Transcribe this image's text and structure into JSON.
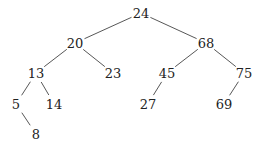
{
  "diagram": {
    "type": "binary-search-tree",
    "nodes": [
      {
        "id": "n24",
        "label": "24",
        "x": 141,
        "y": 13
      },
      {
        "id": "n20",
        "label": "20",
        "x": 75,
        "y": 43
      },
      {
        "id": "n68",
        "label": "68",
        "x": 206,
        "y": 43
      },
      {
        "id": "n13",
        "label": "13",
        "x": 36,
        "y": 73
      },
      {
        "id": "n23",
        "label": "23",
        "x": 113,
        "y": 73
      },
      {
        "id": "n45",
        "label": "45",
        "x": 167,
        "y": 73
      },
      {
        "id": "n75",
        "label": "75",
        "x": 244,
        "y": 73
      },
      {
        "id": "n5",
        "label": "5",
        "x": 16,
        "y": 104
      },
      {
        "id": "n14",
        "label": "14",
        "x": 54,
        "y": 104
      },
      {
        "id": "n27",
        "label": "27",
        "x": 148,
        "y": 104
      },
      {
        "id": "n69",
        "label": "69",
        "x": 224,
        "y": 104
      },
      {
        "id": "n8",
        "label": "8",
        "x": 36,
        "y": 134
      }
    ],
    "edges": [
      {
        "from": "n24",
        "to": "n20"
      },
      {
        "from": "n24",
        "to": "n68"
      },
      {
        "from": "n20",
        "to": "n13"
      },
      {
        "from": "n20",
        "to": "n23"
      },
      {
        "from": "n68",
        "to": "n45"
      },
      {
        "from": "n68",
        "to": "n75"
      },
      {
        "from": "n13",
        "to": "n5"
      },
      {
        "from": "n13",
        "to": "n14"
      },
      {
        "from": "n45",
        "to": "n27"
      },
      {
        "from": "n75",
        "to": "n69"
      },
      {
        "from": "n5",
        "to": "n8"
      }
    ]
  }
}
